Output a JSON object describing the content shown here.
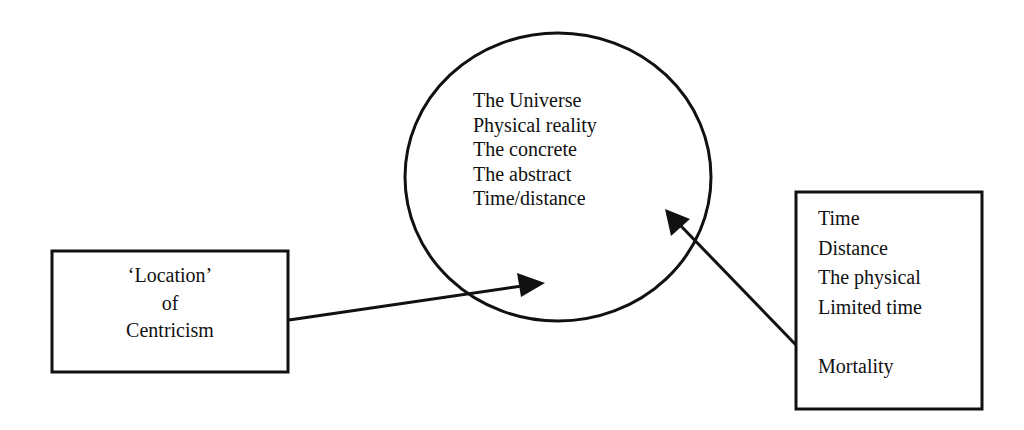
{
  "diagram": {
    "circle": {
      "label": "central-circle",
      "lines": [
        "The Universe",
        "Physical reality",
        "The concrete",
        "The abstract",
        "Time/distance"
      ]
    },
    "left_box": {
      "label": "location-of-centricism-box",
      "lines": [
        "‘Location’",
        "of",
        "Centricism"
      ]
    },
    "right_box": {
      "label": "time-distance-box",
      "lines": [
        "Time",
        "Distance",
        "The physical",
        "Limited time",
        "",
        "Mortality"
      ]
    },
    "arrows": [
      {
        "from": "left_box",
        "to": "circle"
      },
      {
        "from": "right_box",
        "to": "circle"
      }
    ],
    "colors": {
      "stroke": "#111111",
      "background": "#ffffff"
    }
  }
}
